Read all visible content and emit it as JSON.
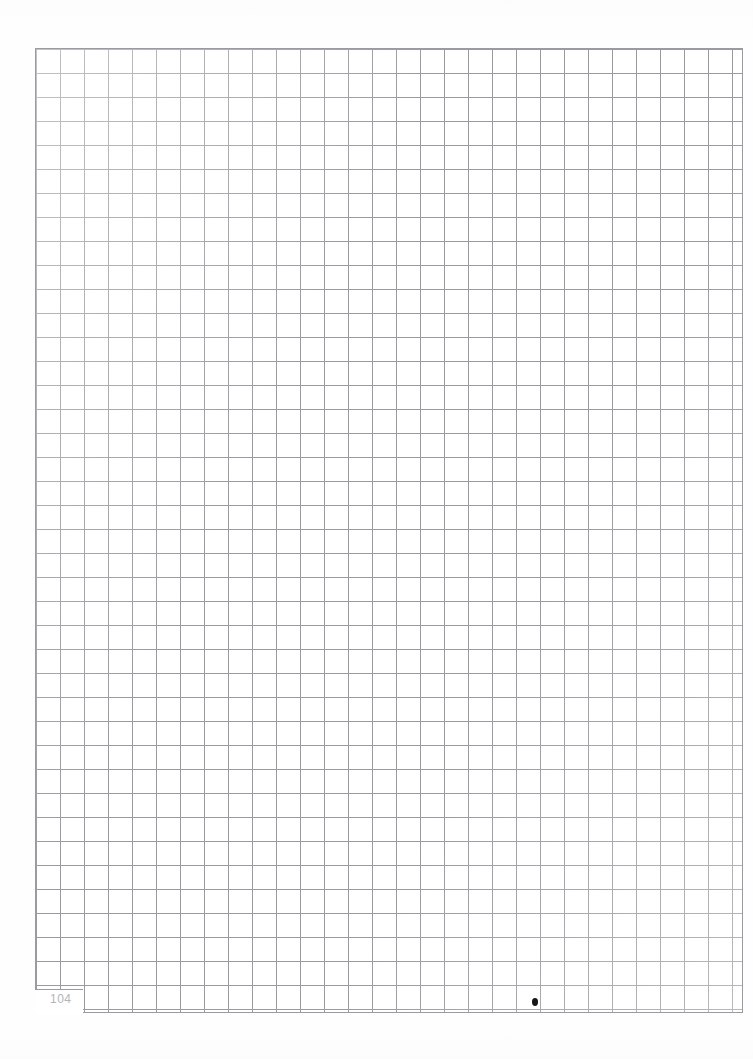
{
  "page": {
    "kind": "graph-paper-sheet",
    "width_px": 753,
    "height_px": 1059,
    "background_color": "#fefefe",
    "folio_number": "104"
  },
  "grid": {
    "cell_size_px": 24,
    "line_color": "#9a9aa0",
    "origin_x_px": 35,
    "origin_y_px": 48,
    "right_edge_x_px": 742,
    "bottom_edge_y_px": 1012,
    "columns": 29,
    "rows": 40,
    "notch": {
      "description": "first two columns stop early to leave room for the folio number",
      "start_x_px": 35,
      "width_px": 48,
      "short_bottom_y_px": 989
    }
  },
  "marks": {
    "ink_dot": {
      "label": "stray ink dot",
      "x_px": 532,
      "y_px": 998,
      "width_px": 6,
      "height_px": 8,
      "color": "#161616"
    }
  }
}
